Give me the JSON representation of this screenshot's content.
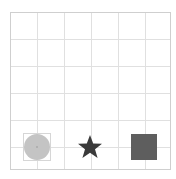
{
  "board": {
    "columns": 6,
    "rows": 6,
    "grid_color": "#e0e0e0",
    "border_color": "#cfcfcf"
  },
  "pieces": [
    {
      "shape": "circle",
      "color": "#c4c4c4",
      "row": 5,
      "col": 0,
      "selected": true
    },
    {
      "shape": "star",
      "color": "#3a3a3a",
      "row": 5,
      "col": 2
    },
    {
      "shape": "square",
      "color": "#5e5e5e",
      "row": 5,
      "col": 4
    }
  ],
  "caption": ""
}
